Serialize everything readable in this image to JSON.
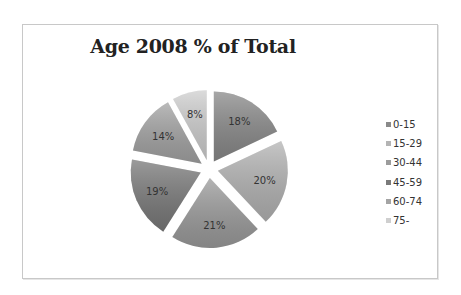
{
  "chart_data": {
    "type": "pie",
    "title": "Age 2008 % of Total",
    "exploded": true,
    "start_angle_deg": 0,
    "direction": "clockwise",
    "categories": [
      "0-15",
      "15-29",
      "30-44",
      "45-59",
      "60-74",
      "75-"
    ],
    "values": [
      18,
      20,
      21,
      19,
      14,
      8
    ],
    "labels": [
      "18%",
      "20%",
      "21%",
      "19%",
      "14%",
      "8%"
    ],
    "colors": [
      "#8a8a8a",
      "#b4b4b4",
      "#9c9c9c",
      "#7a7a7a",
      "#a4a4a4",
      "#cfcfcf"
    ],
    "legend_position": "right"
  },
  "legend": {
    "items": [
      {
        "label": "0-15",
        "color": "#8a8a8a"
      },
      {
        "label": "15-29",
        "color": "#b4b4b4"
      },
      {
        "label": "30-44",
        "color": "#9c9c9c"
      },
      {
        "label": "45-59",
        "color": "#7a7a7a"
      },
      {
        "label": "60-74",
        "color": "#a4a4a4"
      },
      {
        "label": "75-",
        "color": "#cfcfcf"
      }
    ]
  }
}
